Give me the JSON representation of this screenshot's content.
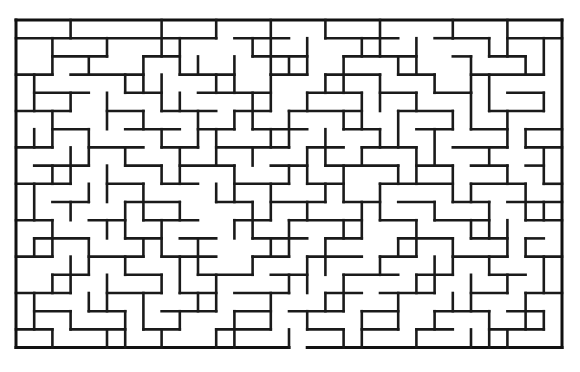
{
  "page": {
    "title": "Maze puzzle",
    "background_color": "#ffffff",
    "wall_color": "#1a1a1a"
  },
  "maze": {
    "name": "rectangular-perfect-maze",
    "origin_x": 16,
    "origin_y": 20,
    "cell_size": 18.2,
    "cols": 30,
    "rows": 18,
    "wall_thickness": 2.6,
    "border_thickness": 3.0,
    "entrance": "none-visible",
    "exit": "none-visible",
    "h_walls": [
      [
        0,
        0,
        30
      ],
      [
        0,
        1,
        11
      ],
      [
        12,
        1,
        3
      ],
      [
        17,
        1,
        4
      ],
      [
        23,
        1,
        1
      ],
      [
        24,
        1,
        2
      ],
      [
        27,
        1,
        3
      ],
      [
        2,
        2,
        3
      ],
      [
        7,
        2,
        2
      ],
      [
        13,
        2,
        3
      ],
      [
        18,
        2,
        4
      ],
      [
        24,
        2,
        1
      ],
      [
        26,
        2,
        2
      ],
      [
        0,
        3,
        2
      ],
      [
        3,
        3,
        4
      ],
      [
        9,
        3,
        3
      ],
      [
        14,
        3,
        2
      ],
      [
        17,
        3,
        3
      ],
      [
        21,
        3,
        2
      ],
      [
        25,
        3,
        4
      ],
      [
        1,
        4,
        3
      ],
      [
        6,
        4,
        2
      ],
      [
        10,
        4,
        4
      ],
      [
        16,
        4,
        3
      ],
      [
        20,
        4,
        2
      ],
      [
        23,
        4,
        2
      ],
      [
        27,
        4,
        2
      ],
      [
        0,
        5,
        3
      ],
      [
        5,
        5,
        2
      ],
      [
        8,
        5,
        3
      ],
      [
        12,
        5,
        2
      ],
      [
        15,
        5,
        4
      ],
      [
        21,
        5,
        3
      ],
      [
        26,
        5,
        3
      ],
      [
        2,
        6,
        2
      ],
      [
        6,
        6,
        3
      ],
      [
        10,
        6,
        2
      ],
      [
        13,
        6,
        3
      ],
      [
        18,
        6,
        2
      ],
      [
        22,
        6,
        2
      ],
      [
        25,
        6,
        2
      ],
      [
        28,
        6,
        2
      ],
      [
        0,
        7,
        2
      ],
      [
        4,
        7,
        3
      ],
      [
        8,
        7,
        2
      ],
      [
        11,
        7,
        4
      ],
      [
        16,
        7,
        2
      ],
      [
        19,
        7,
        3
      ],
      [
        24,
        7,
        3
      ],
      [
        28,
        7,
        2
      ],
      [
        1,
        8,
        3
      ],
      [
        6,
        8,
        2
      ],
      [
        9,
        8,
        3
      ],
      [
        14,
        8,
        2
      ],
      [
        17,
        8,
        4
      ],
      [
        22,
        8,
        2
      ],
      [
        25,
        8,
        2
      ],
      [
        28,
        8,
        1
      ],
      [
        0,
        9,
        3
      ],
      [
        5,
        9,
        2
      ],
      [
        8,
        9,
        2
      ],
      [
        12,
        9,
        3
      ],
      [
        16,
        9,
        2
      ],
      [
        20,
        9,
        4
      ],
      [
        25,
        9,
        3
      ],
      [
        29,
        9,
        1
      ],
      [
        2,
        10,
        2
      ],
      [
        6,
        10,
        3
      ],
      [
        11,
        10,
        2
      ],
      [
        14,
        10,
        3
      ],
      [
        18,
        10,
        2
      ],
      [
        21,
        10,
        2
      ],
      [
        24,
        10,
        2
      ],
      [
        27,
        10,
        3
      ],
      [
        0,
        11,
        2
      ],
      [
        4,
        11,
        2
      ],
      [
        7,
        11,
        3
      ],
      [
        12,
        11,
        2
      ],
      [
        15,
        11,
        4
      ],
      [
        20,
        11,
        2
      ],
      [
        23,
        11,
        3
      ],
      [
        28,
        11,
        2
      ],
      [
        1,
        12,
        3
      ],
      [
        6,
        12,
        2
      ],
      [
        9,
        12,
        2
      ],
      [
        13,
        12,
        3
      ],
      [
        17,
        12,
        2
      ],
      [
        21,
        12,
        3
      ],
      [
        25,
        12,
        2
      ],
      [
        28,
        12,
        1
      ],
      [
        0,
        13,
        2
      ],
      [
        4,
        13,
        3
      ],
      [
        8,
        13,
        3
      ],
      [
        13,
        13,
        2
      ],
      [
        16,
        13,
        3
      ],
      [
        20,
        13,
        2
      ],
      [
        24,
        13,
        3
      ],
      [
        28,
        13,
        2
      ],
      [
        2,
        14,
        2
      ],
      [
        6,
        14,
        2
      ],
      [
        10,
        14,
        3
      ],
      [
        14,
        14,
        2
      ],
      [
        18,
        14,
        3
      ],
      [
        22,
        14,
        2
      ],
      [
        26,
        14,
        2
      ],
      [
        0,
        15,
        3
      ],
      [
        5,
        15,
        3
      ],
      [
        9,
        15,
        2
      ],
      [
        12,
        15,
        3
      ],
      [
        17,
        15,
        2
      ],
      [
        20,
        15,
        3
      ],
      [
        25,
        15,
        2
      ],
      [
        28,
        15,
        2
      ],
      [
        1,
        16,
        2
      ],
      [
        4,
        16,
        2
      ],
      [
        8,
        16,
        3
      ],
      [
        12,
        16,
        2
      ],
      [
        15,
        16,
        3
      ],
      [
        19,
        16,
        2
      ],
      [
        23,
        16,
        3
      ],
      [
        27,
        16,
        2
      ],
      [
        0,
        17,
        2
      ],
      [
        3,
        17,
        3
      ],
      [
        7,
        17,
        2
      ],
      [
        11,
        17,
        3
      ],
      [
        16,
        17,
        2
      ],
      [
        19,
        17,
        2
      ],
      [
        22,
        17,
        2
      ],
      [
        26,
        17,
        3
      ],
      [
        0,
        18,
        15
      ],
      [
        16,
        18,
        14
      ]
    ],
    "v_walls": [
      [
        0,
        0,
        18
      ],
      [
        3,
        0,
        1
      ],
      [
        8,
        0,
        2
      ],
      [
        11,
        0,
        1
      ],
      [
        14,
        0,
        3
      ],
      [
        17,
        0,
        1
      ],
      [
        20,
        0,
        2
      ],
      [
        24,
        0,
        1
      ],
      [
        27,
        0,
        2
      ],
      [
        2,
        1,
        2
      ],
      [
        5,
        1,
        1
      ],
      [
        9,
        1,
        2
      ],
      [
        13,
        1,
        1
      ],
      [
        16,
        1,
        2
      ],
      [
        19,
        1,
        1
      ],
      [
        22,
        1,
        2
      ],
      [
        26,
        1,
        1
      ],
      [
        29,
        1,
        2
      ],
      [
        4,
        2,
        1
      ],
      [
        7,
        2,
        2
      ],
      [
        10,
        2,
        1
      ],
      [
        12,
        2,
        2
      ],
      [
        15,
        2,
        1
      ],
      [
        18,
        2,
        2
      ],
      [
        21,
        2,
        1
      ],
      [
        25,
        2,
        2
      ],
      [
        28,
        2,
        1
      ],
      [
        1,
        3,
        2
      ],
      [
        6,
        3,
        1
      ],
      [
        8,
        3,
        2
      ],
      [
        11,
        3,
        1
      ],
      [
        14,
        3,
        2
      ],
      [
        17,
        3,
        1
      ],
      [
        20,
        3,
        2
      ],
      [
        23,
        3,
        1
      ],
      [
        26,
        3,
        2
      ],
      [
        3,
        4,
        1
      ],
      [
        5,
        4,
        2
      ],
      [
        9,
        4,
        1
      ],
      [
        13,
        4,
        2
      ],
      [
        16,
        4,
        1
      ],
      [
        19,
        4,
        2
      ],
      [
        22,
        4,
        1
      ],
      [
        25,
        4,
        2
      ],
      [
        29,
        4,
        1
      ],
      [
        2,
        5,
        2
      ],
      [
        7,
        5,
        1
      ],
      [
        10,
        5,
        2
      ],
      [
        12,
        5,
        1
      ],
      [
        15,
        5,
        2
      ],
      [
        18,
        5,
        1
      ],
      [
        21,
        5,
        2
      ],
      [
        24,
        5,
        1
      ],
      [
        27,
        5,
        2
      ],
      [
        1,
        6,
        1
      ],
      [
        4,
        6,
        2
      ],
      [
        8,
        6,
        1
      ],
      [
        11,
        6,
        2
      ],
      [
        14,
        6,
        1
      ],
      [
        17,
        6,
        2
      ],
      [
        20,
        6,
        1
      ],
      [
        23,
        6,
        2
      ],
      [
        28,
        6,
        1
      ],
      [
        3,
        7,
        2
      ],
      [
        6,
        7,
        1
      ],
      [
        9,
        7,
        2
      ],
      [
        13,
        7,
        1
      ],
      [
        16,
        7,
        2
      ],
      [
        19,
        7,
        1
      ],
      [
        22,
        7,
        2
      ],
      [
        26,
        7,
        1
      ],
      [
        29,
        7,
        2
      ],
      [
        2,
        8,
        1
      ],
      [
        5,
        8,
        2
      ],
      [
        8,
        8,
        1
      ],
      [
        12,
        8,
        2
      ],
      [
        15,
        8,
        1
      ],
      [
        18,
        8,
        2
      ],
      [
        21,
        8,
        1
      ],
      [
        24,
        8,
        2
      ],
      [
        27,
        8,
        1
      ],
      [
        1,
        9,
        2
      ],
      [
        4,
        9,
        1
      ],
      [
        7,
        9,
        2
      ],
      [
        11,
        9,
        1
      ],
      [
        14,
        9,
        2
      ],
      [
        17,
        9,
        1
      ],
      [
        20,
        9,
        2
      ],
      [
        25,
        9,
        1
      ],
      [
        28,
        9,
        2
      ],
      [
        3,
        10,
        1
      ],
      [
        6,
        10,
        2
      ],
      [
        9,
        10,
        1
      ],
      [
        13,
        10,
        2
      ],
      [
        16,
        10,
        1
      ],
      [
        19,
        10,
        2
      ],
      [
        23,
        10,
        1
      ],
      [
        26,
        10,
        2
      ],
      [
        29,
        10,
        1
      ],
      [
        2,
        11,
        2
      ],
      [
        5,
        11,
        1
      ],
      [
        8,
        11,
        2
      ],
      [
        12,
        11,
        1
      ],
      [
        15,
        11,
        2
      ],
      [
        18,
        11,
        1
      ],
      [
        22,
        11,
        2
      ],
      [
        25,
        11,
        1
      ],
      [
        27,
        11,
        2
      ],
      [
        1,
        12,
        1
      ],
      [
        4,
        12,
        2
      ],
      [
        7,
        12,
        1
      ],
      [
        10,
        12,
        2
      ],
      [
        14,
        12,
        1
      ],
      [
        17,
        12,
        2
      ],
      [
        21,
        12,
        1
      ],
      [
        24,
        12,
        2
      ],
      [
        28,
        12,
        1
      ],
      [
        3,
        13,
        2
      ],
      [
        6,
        13,
        1
      ],
      [
        9,
        13,
        2
      ],
      [
        13,
        13,
        1
      ],
      [
        16,
        13,
        2
      ],
      [
        20,
        13,
        1
      ],
      [
        23,
        13,
        2
      ],
      [
        26,
        13,
        1
      ],
      [
        29,
        13,
        2
      ],
      [
        2,
        14,
        1
      ],
      [
        5,
        14,
        2
      ],
      [
        8,
        14,
        1
      ],
      [
        11,
        14,
        2
      ],
      [
        15,
        14,
        1
      ],
      [
        18,
        14,
        2
      ],
      [
        22,
        14,
        1
      ],
      [
        25,
        14,
        2
      ],
      [
        27,
        14,
        1
      ],
      [
        1,
        15,
        2
      ],
      [
        4,
        15,
        1
      ],
      [
        7,
        15,
        2
      ],
      [
        10,
        15,
        1
      ],
      [
        14,
        15,
        2
      ],
      [
        17,
        15,
        1
      ],
      [
        21,
        15,
        2
      ],
      [
        24,
        15,
        1
      ],
      [
        28,
        15,
        2
      ],
      [
        3,
        16,
        1
      ],
      [
        6,
        16,
        2
      ],
      [
        9,
        16,
        1
      ],
      [
        12,
        16,
        2
      ],
      [
        16,
        16,
        1
      ],
      [
        19,
        16,
        2
      ],
      [
        23,
        16,
        1
      ],
      [
        26,
        16,
        2
      ],
      [
        29,
        16,
        1
      ],
      [
        2,
        17,
        1
      ],
      [
        5,
        17,
        1
      ],
      [
        8,
        17,
        1
      ],
      [
        11,
        17,
        1
      ],
      [
        15,
        17,
        1
      ],
      [
        18,
        17,
        1
      ],
      [
        22,
        17,
        1
      ],
      [
        25,
        17,
        1
      ],
      [
        27,
        17,
        1
      ],
      [
        30,
        0,
        18
      ]
    ]
  }
}
